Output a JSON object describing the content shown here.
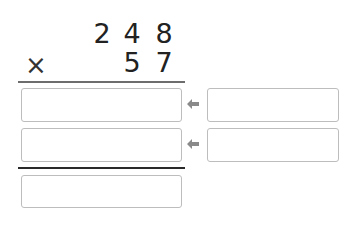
{
  "problem": {
    "operator": "×",
    "multiplicand_digits": [
      "2",
      "4",
      "8"
    ],
    "multiplier_digits": [
      "5",
      "7"
    ]
  },
  "inputs": {
    "partial_product_1": {
      "value": "",
      "placeholder": ""
    },
    "partial_product_2": {
      "value": "",
      "placeholder": ""
    },
    "helper_1": {
      "value": "",
      "placeholder": ""
    },
    "helper_2": {
      "value": "",
      "placeholder": ""
    },
    "final_product": {
      "value": "",
      "placeholder": ""
    }
  },
  "icons": {
    "arrow_1": "arrow-left-icon",
    "arrow_2": "arrow-left-icon"
  },
  "colors": {
    "text": "#222222",
    "rule_top": "#6d6d6d",
    "rule_bottom": "#2a2a2a",
    "box_border": "#bdbdbd",
    "arrow": "#8a8a8a"
  }
}
